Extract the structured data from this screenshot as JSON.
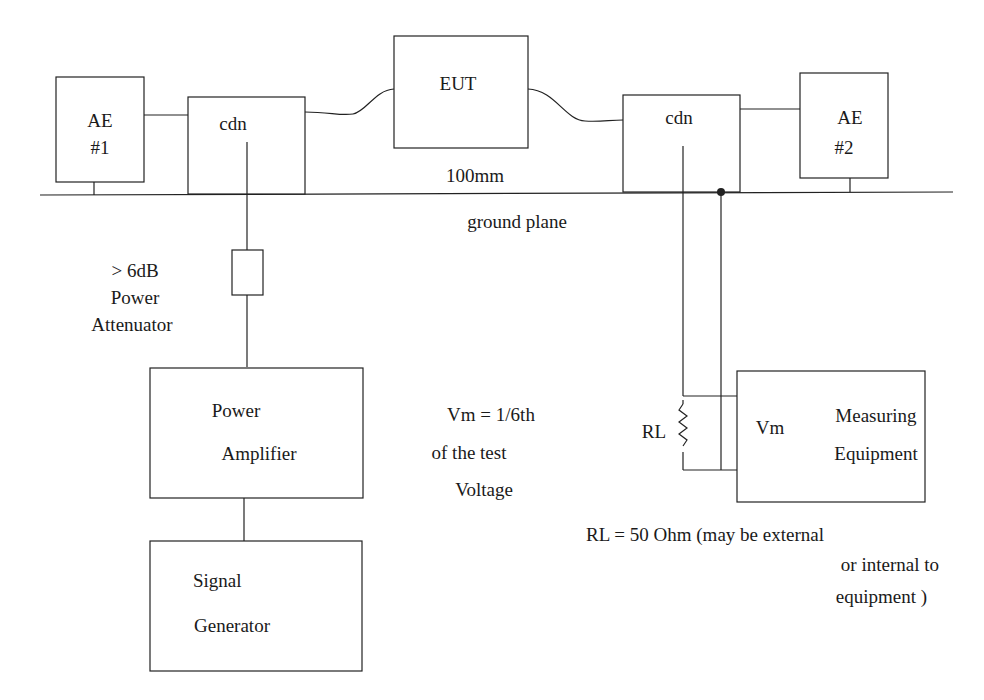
{
  "diagram": {
    "type": "block-diagram",
    "blocks": {
      "ae1": {
        "line1": "AE",
        "line2": "#1"
      },
      "cdn_left": {
        "label": "cdn"
      },
      "eut": {
        "label": "EUT"
      },
      "cdn_right": {
        "label": "cdn"
      },
      "ae2": {
        "line1": "AE",
        "line2": "#2"
      },
      "power_amplifier": {
        "line1": "Power",
        "line2": "Amplifier"
      },
      "signal_generator": {
        "line1": "Signal",
        "line2": "Generator"
      },
      "measuring_equipment": {
        "vm": "Vm",
        "line1": "Measuring",
        "line2": "Equipment"
      }
    },
    "labels": {
      "height": "100mm",
      "ground_plane": "ground plane",
      "attenuator_line1": "> 6dB",
      "attenuator_line2": "Power",
      "attenuator_line3": "Attenuator",
      "vm_note_line1": "Vm = 1/6th",
      "vm_note_line2": "of the test",
      "vm_note_line3": "Voltage",
      "rl": "RL",
      "rl_note_line1": "RL = 50 Ohm (may be external",
      "rl_note_line2": "or internal to",
      "rl_note_line3": "equipment )"
    }
  }
}
